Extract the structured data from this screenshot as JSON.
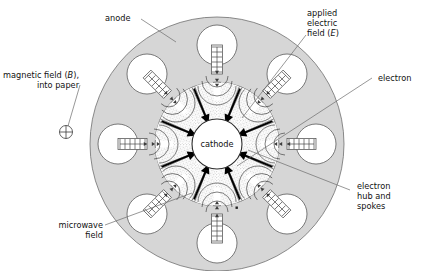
{
  "figure": {
    "type": "magnetron-cross-section-diagram",
    "center_label": "cathode",
    "background_color": "#ffffff",
    "anode_color": "#d6d6d6",
    "cavity_color": "#ffffff",
    "spoke_color": "#9a9a9a",
    "arrow_color": "#000000",
    "leader_color": "#6b6b6b",
    "cavity_count": 8,
    "electric_field_arrow_count": 8
  },
  "labels": {
    "anode": "anode",
    "magnetic_field_line1": "magnetic field (",
    "magnetic_field_sym": "B",
    "magnetic_field_line1_end": "),",
    "magnetic_field_line2": "into paper",
    "applied_field_line1": "applied",
    "applied_field_line2": "electric",
    "applied_field_line3a": "field (",
    "applied_field_sym": "E",
    "applied_field_line3b": ")",
    "electron": "electron",
    "hub_line1": "electron",
    "hub_line2": "hub and",
    "hub_line3": "spokes",
    "microwave_line1": "microwave",
    "microwave_line2": "field",
    "cathode": "cathode"
  },
  "icons": {
    "b_field_symbol": "circle-plus-into-page-icon",
    "electron_dot": "electron-dot-icon"
  }
}
